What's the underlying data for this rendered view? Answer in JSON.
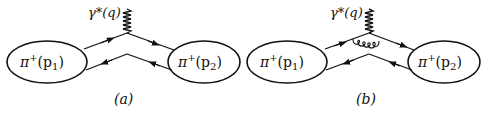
{
  "diagrams": [
    {
      "id": "a",
      "caption": "(a)",
      "photon_label": "γ*(q)",
      "left_blob": {
        "label_pi": "π",
        "label_sup": "+",
        "label_arg": "(p",
        "label_sub": "1",
        "label_close": ")"
      },
      "right_blob": {
        "label_pi": "π",
        "label_sup": "+",
        "label_arg": "(p",
        "label_sub": "2",
        "label_close": ")"
      },
      "has_gluon": false
    },
    {
      "id": "b",
      "caption": "(b)",
      "photon_label": "γ*(q)",
      "left_blob": {
        "label_pi": "π",
        "label_sup": "+",
        "label_arg": "(p",
        "label_sub": "1",
        "label_close": ")"
      },
      "right_blob": {
        "label_pi": "π",
        "label_sup": "+",
        "label_arg": "(p",
        "label_sub": "2",
        "label_close": ")"
      },
      "has_gluon": true
    }
  ],
  "colors": {
    "stroke": "#111111",
    "background": "#ffffff"
  }
}
